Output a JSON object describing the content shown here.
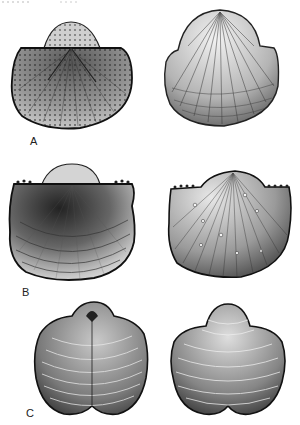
{
  "figure": {
    "type": "scientific-illustration",
    "rows": [
      {
        "label": "A",
        "left": {
          "view": "interior-dorsal",
          "ornament": "radial pitted costae with hinge line and umbo"
        },
        "right": {
          "view": "exterior",
          "ornament": "fine radial costae with concentric growth lines"
        }
      },
      {
        "label": "B",
        "left": {
          "view": "exterior-concentric",
          "ornament": "concentric growth lamellae, spines along hinge"
        },
        "right": {
          "view": "exterior-costate",
          "ornament": "fine radial costellae with spine bases, spinose hinge"
        }
      },
      {
        "label": "C",
        "left": {
          "view": "dorsal",
          "ornament": "concentric rugae with median sulcus"
        },
        "right": {
          "view": "ventral",
          "ornament": "concentric rugae with median fold"
        }
      }
    ],
    "colors": {
      "ink": "#1a1a1a",
      "paper": "#ffffff",
      "shade": "#6b6b6b"
    }
  }
}
